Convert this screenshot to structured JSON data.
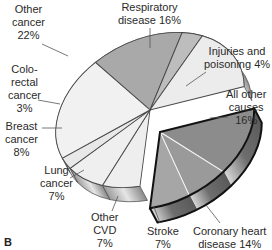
{
  "panel_label": "B",
  "chart_data": {
    "type": "pie",
    "style": "3d-exploded",
    "title": "",
    "unit": "%",
    "categories": [
      "Respiratory disease",
      "Injuries and poisoning",
      "All other causes",
      "Coronary heart disease",
      "Stroke",
      "Other CVD",
      "Lung cancer",
      "Breast cancer",
      "Colorectal cancer",
      "Other cancer"
    ],
    "values": [
      16,
      4,
      16,
      14,
      7,
      7,
      7,
      8,
      3,
      22
    ],
    "exploded_group": [
      "Coronary heart disease",
      "Stroke",
      "Other CVD"
    ],
    "legend": "none (direct labels with leader lines)",
    "colors": {
      "Respiratory disease": "#a9a9a9",
      "Injuries and poisoning": "#bdbdbd",
      "All other causes": "#ececec",
      "Coronary heart disease": "#8c8c8c",
      "Stroke": "#9a9a9a",
      "Other CVD": "#a6a6a6",
      "Lung cancer": "#eeeeee",
      "Breast cancer": "#efefef",
      "Colorectal cancer": "#e8e8e8",
      "Other cancer": "#f1f1f1",
      "outline": "#3a3a3a",
      "exploded_outline": "#111111"
    }
  },
  "labels": {
    "respiratory": [
      "Respiratory",
      "disease 16%"
    ],
    "injuries": [
      "Injuries and",
      "poisoning 4%"
    ],
    "all_other": [
      "All other",
      "causes",
      "16%"
    ],
    "coronary": [
      "Coronary heart",
      "disease 14%"
    ],
    "stroke": [
      "Stroke",
      "7%"
    ],
    "other_cvd": [
      "Other",
      "CVD",
      "7%"
    ],
    "lung": [
      "Lung",
      "cancer",
      "7%"
    ],
    "breast": [
      "Breast",
      "cancer",
      "8%"
    ],
    "colorectal": [
      "Colo-",
      "rectal",
      "cancer",
      "3%"
    ],
    "other_cancer": [
      "Other",
      "cancer",
      "22%"
    ]
  }
}
